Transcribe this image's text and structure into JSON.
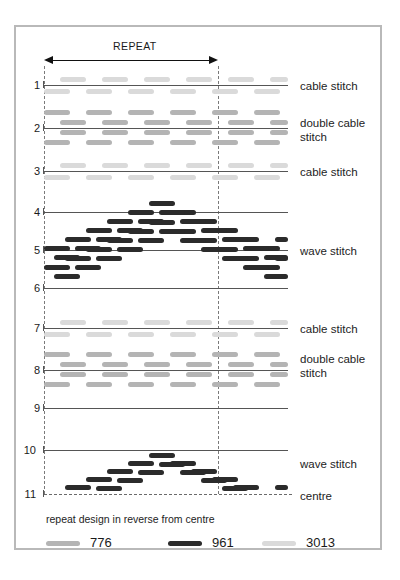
{
  "chart_data": {
    "type": "table",
    "repeat_label": "REPEAT",
    "footnote": "repeat design in reverse from centre",
    "centre_label": "centre",
    "row_numbers": [
      "1",
      "2",
      "3",
      "4",
      "5",
      "6",
      "7",
      "8",
      "9",
      "10",
      "11"
    ],
    "row_labels": [
      {
        "row": "1",
        "text": "cable stitch"
      },
      {
        "row": "2",
        "text": "double cable stitch"
      },
      {
        "row": "3",
        "text": "cable stitch"
      },
      {
        "row": "5",
        "text": "wave stitch"
      },
      {
        "row": "7",
        "text": "cable stitch"
      },
      {
        "row": "8",
        "text": "double cable stitch"
      },
      {
        "row": "10",
        "text": "wave stitch"
      },
      {
        "row": "11",
        "text": "centre"
      }
    ],
    "legend": [
      {
        "code": "776",
        "color": "#b4b4b4"
      },
      {
        "code": "961",
        "color": "#2b2b2b"
      },
      {
        "code": "3013",
        "color": "#dadada"
      }
    ],
    "colors": {
      "776": "#b4b4b4",
      "961": "#2b2b2b",
      "3013": "#dadada",
      "rule": "#555555",
      "frame": "#b9b9b9",
      "text": "#1a1a1a"
    },
    "axis": {
      "repeat_start_x": 44,
      "repeat_end_x": 218,
      "chart_left_x": 44,
      "chart_right_x": 288
    }
  },
  "labels": {
    "repeat": "REPEAT",
    "cable_stitch": "cable stitch",
    "double_cable_stitch": "double cable\nstitch",
    "wave_stitch": "wave stitch",
    "centre": "centre",
    "footnote": "repeat design in reverse from centre"
  },
  "rows": {
    "n1": "1",
    "n2": "2",
    "n3": "3",
    "n4": "4",
    "n5": "5",
    "n6": "6",
    "n7": "7",
    "n8": "8",
    "n9": "9",
    "n10": "10",
    "n11": "11"
  },
  "legend": {
    "c1": "776",
    "c2": "961",
    "c3": "3013"
  }
}
